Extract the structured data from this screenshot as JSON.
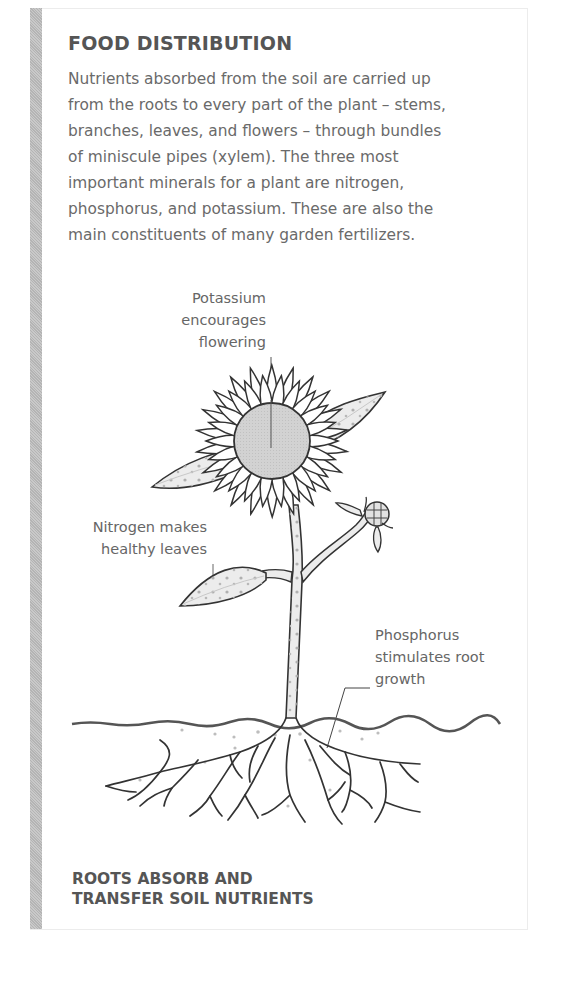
{
  "panel": {
    "title": "FOOD DISTRIBUTION",
    "body_lines": [
      "Nutrients absorbed from the soil are carried up",
      "from the roots to every part of the plant – stems,",
      "branches, leaves, and flowers – through bundles",
      "of miniscule pipes (xylem). The three most",
      "important minerals for a plant are nitrogen,",
      "phosphorus, and potassium. These are also the",
      "main constituents of many garden fertilizers."
    ]
  },
  "diagram": {
    "labels": {
      "potassium": [
        "Potassium",
        "encourages",
        "flowering"
      ],
      "nitrogen": [
        "Nitrogen makes",
        "healthy leaves"
      ],
      "phosphorus": [
        "Phosphorus",
        "stimulates root",
        "growth"
      ]
    },
    "icons": [
      "sunflower-illustration",
      "leaf-icon",
      "flower-bud-icon",
      "stem-icon",
      "soil-line",
      "roots-illustration"
    ],
    "colors": {
      "line": "#333333",
      "fill": "#e8e8e8",
      "center": "#cfcfcf",
      "dots": "#a8a8a8"
    }
  },
  "caption": {
    "lines": [
      "ROOTS ABSORB AND",
      "TRANSFER SOIL NUTRIENTS"
    ]
  }
}
